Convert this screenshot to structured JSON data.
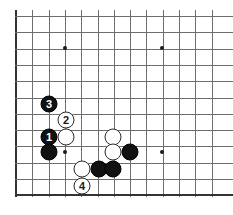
{
  "board": {
    "type": "go-board-diagram",
    "width": 233,
    "height": 215,
    "background_color": "#ffffff",
    "grid_line_color": "#6e6e6e",
    "edge_line_color": "#333333",
    "cell_size": 16.3,
    "origin_x": 16,
    "origin_y": 16,
    "columns": 13,
    "rows": 12,
    "edges": {
      "left": true,
      "bottom": true,
      "top": false,
      "right": false
    },
    "star_points": [
      {
        "name": "star-top-left",
        "x": 65,
        "y": 48
      },
      {
        "name": "star-top-right",
        "x": 162,
        "y": 48
      },
      {
        "name": "star-bottom-left",
        "x": 65,
        "y": 152
      },
      {
        "name": "star-bottom-right",
        "x": 162,
        "y": 152
      }
    ],
    "stones": [
      {
        "name": "black-stone-move-3",
        "color": "black",
        "label": "3",
        "x": 49,
        "y": 104
      },
      {
        "name": "white-stone-move-2",
        "color": "white",
        "label": "2",
        "x": 66,
        "y": 120
      },
      {
        "name": "black-stone-move-1",
        "color": "black",
        "label": "1",
        "x": 49,
        "y": 137
      },
      {
        "name": "white-stone-left",
        "color": "white",
        "label": "",
        "x": 66,
        "y": 137
      },
      {
        "name": "black-stone-left-lower",
        "color": "black",
        "label": "",
        "x": 49,
        "y": 152
      },
      {
        "name": "white-stone-lower-left",
        "color": "white",
        "label": "",
        "x": 82,
        "y": 169
      },
      {
        "name": "white-stone-move-4",
        "color": "white",
        "label": "4",
        "x": 82,
        "y": 186
      },
      {
        "name": "white-stone-center-upper",
        "color": "white",
        "label": "",
        "x": 113,
        "y": 137
      },
      {
        "name": "white-stone-center-lower",
        "color": "white",
        "label": "",
        "x": 113,
        "y": 152
      },
      {
        "name": "black-stone-center-right",
        "color": "black",
        "label": "",
        "x": 130,
        "y": 152
      },
      {
        "name": "black-stone-bottom-left",
        "color": "black",
        "label": "",
        "x": 99,
        "y": 169
      },
      {
        "name": "black-stone-bottom-center",
        "color": "black",
        "label": "",
        "x": 113,
        "y": 169
      }
    ]
  }
}
